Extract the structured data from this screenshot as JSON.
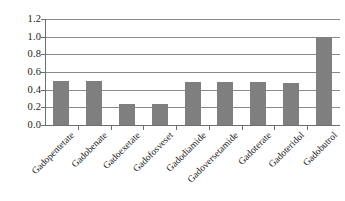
{
  "chart_data": {
    "type": "bar",
    "title": "",
    "subtitle": "",
    "xlabel": "",
    "ylabel": "",
    "categories": [
      "Gadopentetate",
      "Gadobenate",
      "Gadoexetate",
      "Gadofosveset",
      "Gadodiamide",
      "Gadoversetamide",
      "Gadoterate",
      "Gadoteridol",
      "Gadobutrol"
    ],
    "values": [
      0.5,
      0.5,
      0.24,
      0.24,
      0.49,
      0.49,
      0.49,
      0.48,
      1.0
    ],
    "ylim": [
      0.0,
      1.2
    ],
    "ytick_values": [
      0.0,
      0.2,
      0.4,
      0.6,
      0.8,
      1.0,
      1.2
    ],
    "ytick_labels": [
      "0.0",
      "0.2",
      "0.4",
      "0.6",
      "0.8",
      "1.0",
      "1.2"
    ],
    "grid": true,
    "grid_axis": "y",
    "legend": false,
    "legend_position": "none",
    "bar_color": "#7f7f7f",
    "grid_color": "#8a8a8a",
    "axis_color": "#6e6e6e",
    "background_color": "#ffffff",
    "xlabel_rotation": -45,
    "series": [
      {
        "name": "",
        "values": [
          0.5,
          0.5,
          0.24,
          0.24,
          0.49,
          0.49,
          0.49,
          0.48,
          1.0
        ]
      }
    ]
  }
}
